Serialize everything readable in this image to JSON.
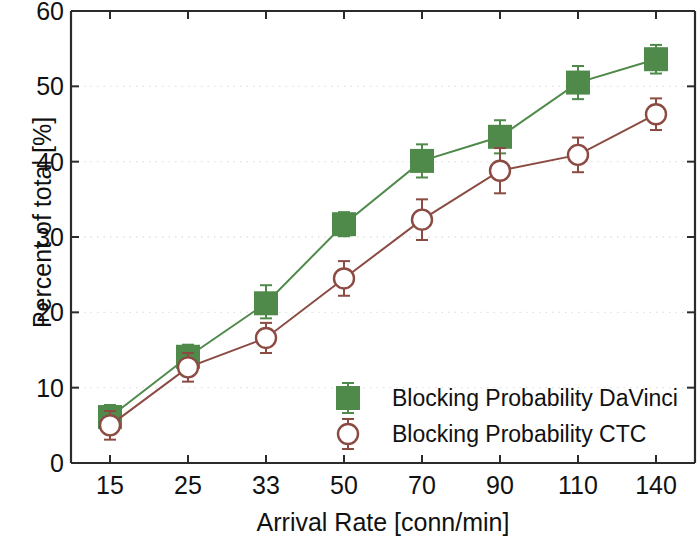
{
  "chart_data": {
    "type": "line",
    "title": "",
    "xlabel": "Arrival Rate [conn/min]",
    "ylabel": "Percent of total [%]",
    "categories": [
      "15",
      "25",
      "33",
      "50",
      "70",
      "90",
      "110",
      "140"
    ],
    "x_tick_labels": [
      "15",
      "25",
      "33",
      "50",
      "70",
      "90",
      "110",
      "140"
    ],
    "y_tick_labels": [
      "0",
      "10",
      "20",
      "30",
      "40",
      "50",
      "60"
    ],
    "y_ticks": [
      0,
      10,
      20,
      30,
      40,
      50,
      60
    ],
    "ylim": [
      0,
      60
    ],
    "grid": true,
    "legend_position": "lower-right-inside",
    "series": [
      {
        "name": "Blocking Probability DaVinci",
        "color": "#4f8a4b",
        "marker": "filled-square",
        "values": [
          6.1,
          14.1,
          21.2,
          31.7,
          40.1,
          43.3,
          50.5,
          53.6
        ],
        "err_low": [
          1.6,
          1.6,
          2.0,
          1.6,
          2.2,
          2.2,
          2.2,
          1.9
        ],
        "err_high": [
          1.6,
          1.6,
          2.4,
          1.6,
          2.2,
          2.2,
          2.2,
          1.9
        ]
      },
      {
        "name": "Blocking Probability CTC",
        "color": "#8b4b43",
        "marker": "open-circle",
        "values": [
          5.0,
          12.7,
          16.6,
          24.5,
          32.3,
          38.8,
          40.9,
          46.3
        ],
        "err_low": [
          1.9,
          1.9,
          2.0,
          2.3,
          2.7,
          3.0,
          2.3,
          2.1
        ],
        "err_high": [
          1.9,
          1.9,
          2.0,
          2.3,
          2.7,
          3.0,
          2.3,
          2.1
        ]
      }
    ]
  },
  "legend": {
    "entries": [
      {
        "label": "Blocking Probability DaVinci"
      },
      {
        "label": "Blocking Probability CTC"
      }
    ]
  },
  "axes": {
    "x_title": "Arrival Rate [conn/min]",
    "y_title": "Percent of total [%]"
  }
}
